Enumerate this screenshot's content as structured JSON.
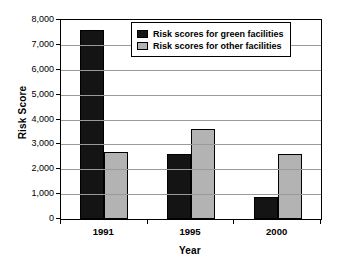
{
  "chart_data": {
    "type": "bar",
    "title": "",
    "xlabel": "Year",
    "ylabel": "Risk Score",
    "categories": [
      "1991",
      "1995",
      "2000"
    ],
    "series": [
      {
        "name": "Risk scores for green facilities",
        "color": "#141414",
        "values": [
          7590,
          2610,
          880
        ]
      },
      {
        "name": "Risk scores for other facilities",
        "color": "#b3b3b3",
        "values": [
          2690,
          3610,
          2600
        ]
      }
    ],
    "ylim": [
      0,
      8000
    ],
    "ytick_values": [
      0,
      1000,
      2000,
      3000,
      4000,
      5000,
      6000,
      7000,
      8000
    ],
    "ytick_labels": [
      "0",
      "1,000",
      "2,000",
      "3,000",
      "4,000",
      "5,000",
      "6,000",
      "7,000",
      "8,000"
    ],
    "grid": true,
    "legend_position": "top-right-inside"
  }
}
